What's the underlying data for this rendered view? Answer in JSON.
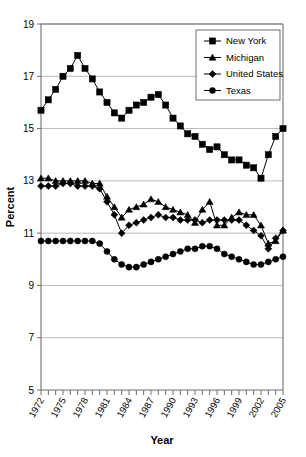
{
  "chart_data": {
    "type": "line",
    "title": "",
    "xlabel": "Year",
    "ylabel": "Percent",
    "ylim": [
      5,
      19
    ],
    "yticks": [
      5,
      7,
      9,
      11,
      13,
      15,
      17,
      19
    ],
    "xlim": [
      1972,
      2005
    ],
    "xticks": [
      1972,
      1975,
      1978,
      1981,
      1984,
      1987,
      1990,
      1993,
      1996,
      1999,
      2002,
      2005
    ],
    "x": [
      1972,
      1973,
      1974,
      1975,
      1976,
      1977,
      1978,
      1979,
      1980,
      1981,
      1982,
      1983,
      1984,
      1985,
      1986,
      1987,
      1988,
      1989,
      1990,
      1991,
      1992,
      1993,
      1994,
      1995,
      1996,
      1997,
      1998,
      1999,
      2000,
      2001,
      2002,
      2003,
      2004,
      2005
    ],
    "grid": true,
    "legend_position": "top-right",
    "series": [
      {
        "name": "New York",
        "marker": "square",
        "values": [
          15.7,
          16.1,
          16.5,
          17.0,
          17.3,
          17.8,
          17.3,
          16.9,
          16.4,
          16.0,
          15.6,
          15.4,
          15.7,
          15.9,
          16.0,
          16.2,
          16.3,
          15.9,
          15.4,
          15.1,
          14.8,
          14.7,
          14.4,
          14.2,
          14.3,
          14.0,
          13.8,
          13.8,
          13.6,
          13.5,
          13.1,
          14.0,
          14.7,
          15.0
        ]
      },
      {
        "name": "Michigan",
        "marker": "triangle",
        "values": [
          13.1,
          13.1,
          13.0,
          13.0,
          13.0,
          13.0,
          13.0,
          12.9,
          12.9,
          12.4,
          12.0,
          11.6,
          11.9,
          12.0,
          12.1,
          12.3,
          12.2,
          12.0,
          11.9,
          11.8,
          11.7,
          11.4,
          11.9,
          12.2,
          11.3,
          11.3,
          11.6,
          11.8,
          11.7,
          11.7,
          11.3,
          10.6,
          10.7,
          11.1
        ]
      },
      {
        "name": "United States",
        "marker": "diamond",
        "values": [
          12.8,
          12.8,
          12.8,
          12.9,
          12.9,
          12.8,
          12.8,
          12.8,
          12.7,
          12.2,
          11.7,
          11.0,
          11.3,
          11.4,
          11.5,
          11.6,
          11.7,
          11.6,
          11.6,
          11.5,
          11.5,
          11.5,
          11.4,
          11.5,
          11.5,
          11.5,
          11.5,
          11.5,
          11.3,
          11.1,
          10.9,
          10.4,
          10.8,
          11.1
        ]
      },
      {
        "name": "Texas",
        "marker": "circle",
        "values": [
          10.7,
          10.7,
          10.7,
          10.7,
          10.7,
          10.7,
          10.7,
          10.7,
          10.6,
          10.3,
          10.0,
          9.8,
          9.7,
          9.7,
          9.8,
          9.9,
          10.0,
          10.1,
          10.2,
          10.3,
          10.4,
          10.4,
          10.5,
          10.5,
          10.4,
          10.2,
          10.1,
          10.0,
          9.9,
          9.8,
          9.8,
          9.9,
          10.0,
          10.1
        ]
      }
    ]
  },
  "legend": {
    "items": [
      {
        "label": "New York",
        "marker": "square"
      },
      {
        "label": "Michigan",
        "marker": "triangle"
      },
      {
        "label": "United States",
        "marker": "diamond"
      },
      {
        "label": "Texas",
        "marker": "circle"
      }
    ]
  },
  "colors": {
    "series": "#000000",
    "grid": "#9a9a9a",
    "axis": "#6e6e6e",
    "background": "#ffffff"
  }
}
